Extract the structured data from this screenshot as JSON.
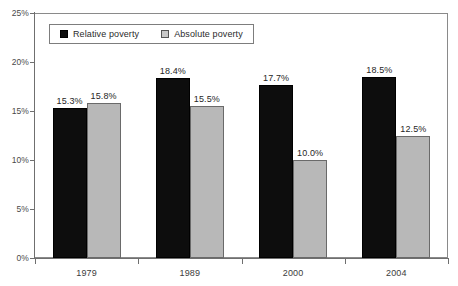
{
  "chart_data": {
    "type": "bar",
    "title": "",
    "subtitle": "",
    "xlabel": "",
    "ylabel": "",
    "categories": [
      "1979",
      "1989",
      "2000",
      "2004"
    ],
    "series": [
      {
        "name": "Relative poverty",
        "color": "#0d0d0d",
        "values": [
          15.3,
          18.4,
          17.7,
          18.5
        ],
        "labels": [
          "15.3%",
          "18.4%",
          "17.7%",
          "18.5%"
        ]
      },
      {
        "name": "Absolute poverty",
        "color": "#b8b8b8",
        "values": [
          15.8,
          15.5,
          10.0,
          12.5
        ],
        "labels": [
          "15.8%",
          "15.5%",
          "10.0%",
          "12.5%"
        ]
      }
    ],
    "ylim": [
      0,
      25
    ],
    "ytick_values": [
      0,
      5,
      10,
      15,
      20,
      25
    ],
    "ytick_labels": [
      "0%",
      "5%",
      "10%",
      "15%",
      "20%",
      "25%"
    ],
    "grid": false,
    "legend_position": "top-left-inside",
    "legend_entries": [
      "Relative poverty",
      "Absolute poverty"
    ],
    "axis_color": "#6f6f6f",
    "frame_color": "#8a8a8a"
  }
}
